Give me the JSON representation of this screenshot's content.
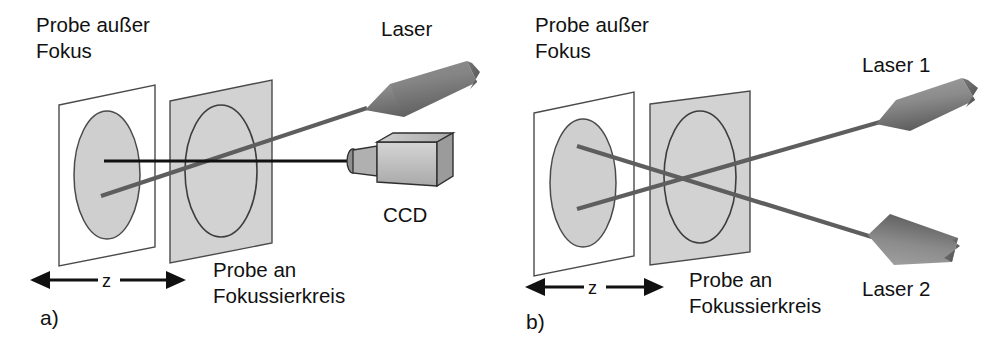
{
  "figure": {
    "panels": [
      {
        "id": "a",
        "panel_label": "a)",
        "labels": {
          "sample_out_of_focus": "Probe außer\nFokus",
          "sample_out_of_focus_line1": "Probe außer",
          "sample_out_of_focus_line2": "Fokus",
          "sample_at_focus_line1": "Probe an",
          "sample_at_focus_line2": "Fokussierkreis",
          "laser": "Laser",
          "detector": "CCD",
          "distance_axis": "z"
        }
      },
      {
        "id": "b",
        "panel_label": "b)",
        "labels": {
          "sample_out_of_focus_line1": "Probe außer",
          "sample_out_of_focus_line2": "Fokus",
          "sample_at_focus_line1": "Probe an",
          "sample_at_focus_line2": "Fokussierkreis",
          "laser_1": "Laser 1",
          "laser_2": "Laser 2",
          "distance_axis": "z"
        }
      }
    ],
    "colors": {
      "background": "#ffffff",
      "text": "#111111",
      "plane_outline_stroke": "#4a4a4a",
      "plane_fill_gray": "#d2d2d2",
      "ellipse_fill_gray": "#cfcfcf",
      "beam_gray": "#5e5e5e",
      "sightline_black": "#111111",
      "laser_body_light": "#b4b4b4",
      "laser_body_dark": "#6f6f6f",
      "ccd_body": "#c6c6c6"
    },
    "icons": {
      "laser_a": "laser-wedge-icon",
      "laser_b1": "laser-wedge-icon",
      "laser_b2": "laser-wedge-icon",
      "ccd": "ccd-camera-icon",
      "z_arrow": "double-arrow-icon",
      "plane_out_of_focus": "sample-plane-icon",
      "plane_at_focus": "sample-plane-icon"
    }
  }
}
